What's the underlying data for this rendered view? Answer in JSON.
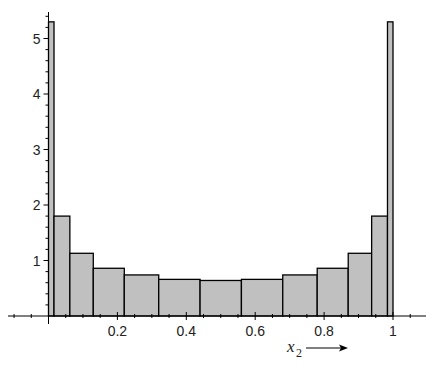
{
  "chart_data": {
    "type": "bar",
    "subtype": "histogram",
    "title": "",
    "xlabel": "x",
    "xlabel_subscript": "2",
    "xlabel_arrow": "→",
    "ylabel": "",
    "xlim": [
      0,
      1
    ],
    "ylim": [
      0,
      5.4
    ],
    "grid": false,
    "bar_color": "#c0c0c0",
    "edge_color": "#000000",
    "x_ticks": [
      0.2,
      0.4,
      0.6,
      0.8,
      1
    ],
    "x_tick_labels": [
      "0.2",
      "0.4",
      "0.6",
      "0.8",
      "1"
    ],
    "y_ticks": [
      1,
      2,
      3,
      4,
      5
    ],
    "y_tick_labels": [
      "1",
      "2",
      "3",
      "4",
      "5"
    ],
    "bins": [
      {
        "left": 0.0,
        "right": 0.016,
        "value": 5.3
      },
      {
        "left": 0.016,
        "right": 0.062,
        "value": 1.8
      },
      {
        "left": 0.062,
        "right": 0.13,
        "value": 1.13
      },
      {
        "left": 0.13,
        "right": 0.22,
        "value": 0.86
      },
      {
        "left": 0.22,
        "right": 0.32,
        "value": 0.74
      },
      {
        "left": 0.32,
        "right": 0.44,
        "value": 0.66
      },
      {
        "left": 0.44,
        "right": 0.56,
        "value": 0.64
      },
      {
        "left": 0.56,
        "right": 0.68,
        "value": 0.66
      },
      {
        "left": 0.68,
        "right": 0.78,
        "value": 0.74
      },
      {
        "left": 0.78,
        "right": 0.87,
        "value": 0.86
      },
      {
        "left": 0.87,
        "right": 0.938,
        "value": 1.13
      },
      {
        "left": 0.938,
        "right": 0.984,
        "value": 1.8
      },
      {
        "left": 0.984,
        "right": 1.0,
        "value": 5.3
      }
    ]
  }
}
